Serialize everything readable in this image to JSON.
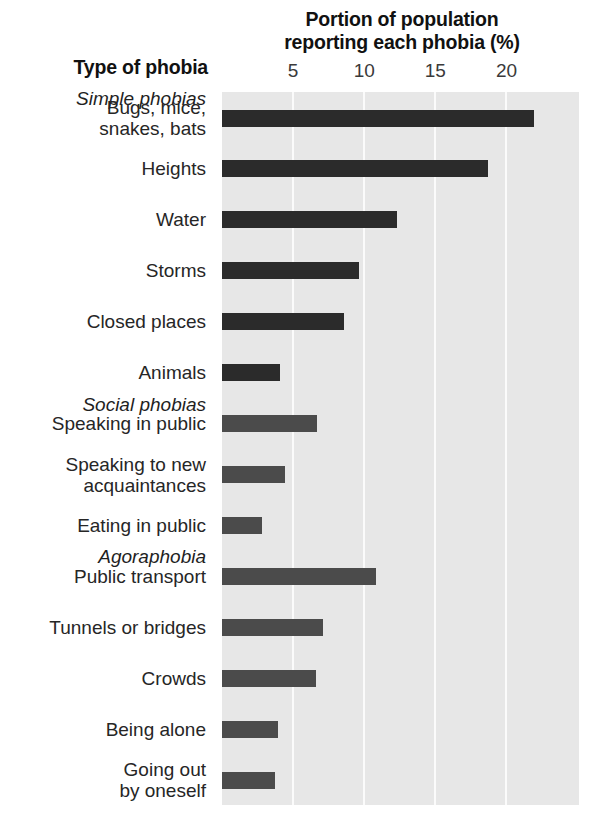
{
  "chart_data": {
    "type": "bar",
    "orientation": "horizontal",
    "title": "Portion of population reporting each phobia (%)",
    "xlabel": "Portion of population reporting each phobia (%)",
    "ylabel": "Type of phobia",
    "xlim": [
      0,
      25.1
    ],
    "xticks": [
      5,
      10,
      15,
      20
    ],
    "xtick_labels": [
      "5",
      "10",
      "15",
      "20"
    ],
    "grid": "vertical-white-on-gray",
    "legend": "none",
    "group_headers": [
      {
        "label": "Simple phobias",
        "before_category": "Bugs, mice, snakes, bats"
      },
      {
        "label": "Social phobias",
        "before_category": "Speaking in public"
      },
      {
        "label": "Agoraphobia",
        "before_category": "Public transport"
      }
    ],
    "categories": [
      "Bugs, mice, snakes, bats",
      "Heights",
      "Water",
      "Storms",
      "Closed places",
      "Animals",
      "Speaking in public",
      "Speaking to new acquaintances",
      "Eating in public",
      "Public transport",
      "Tunnels or bridges",
      "Crowds",
      "Being alone",
      "Going out by oneself"
    ],
    "values": [
      21.9,
      18.7,
      12.3,
      9.6,
      8.6,
      4.1,
      6.7,
      4.4,
      2.8,
      10.8,
      7.1,
      6.6,
      3.9,
      3.7
    ],
    "groups": [
      "simple",
      "simple",
      "simple",
      "simple",
      "simple",
      "simple",
      "social",
      "social",
      "social",
      "agora",
      "agora",
      "agora",
      "agora",
      "agora"
    ]
  },
  "titles": {
    "axis_title_line1": "Portion of population",
    "axis_title_line2": "reporting each phobia (%)",
    "category_axis_title": "Type of phobia"
  },
  "rows": [
    {
      "kind": "header",
      "label": "Simple phobias"
    },
    {
      "kind": "bar",
      "label_lines": [
        "Bugs, mice,",
        "snakes, bats"
      ],
      "value": 21.9,
      "group": "simple"
    },
    {
      "kind": "bar",
      "label_lines": [
        "Heights"
      ],
      "value": 18.7,
      "group": "simple"
    },
    {
      "kind": "bar",
      "label_lines": [
        "Water"
      ],
      "value": 12.3,
      "group": "simple"
    },
    {
      "kind": "bar",
      "label_lines": [
        "Storms"
      ],
      "value": 9.6,
      "group": "simple"
    },
    {
      "kind": "bar",
      "label_lines": [
        "Closed places"
      ],
      "value": 8.6,
      "group": "simple"
    },
    {
      "kind": "bar",
      "label_lines": [
        "Animals"
      ],
      "value": 4.1,
      "group": "simple"
    },
    {
      "kind": "header",
      "label": "Social phobias"
    },
    {
      "kind": "bar",
      "label_lines": [
        "Speaking in public"
      ],
      "value": 6.7,
      "group": "social"
    },
    {
      "kind": "bar",
      "label_lines": [
        "Speaking to new",
        "acquaintances"
      ],
      "value": 4.4,
      "group": "social"
    },
    {
      "kind": "bar",
      "label_lines": [
        "Eating in public"
      ],
      "value": 2.8,
      "group": "social"
    },
    {
      "kind": "header",
      "label": "Agoraphobia"
    },
    {
      "kind": "bar",
      "label_lines": [
        "Public transport"
      ],
      "value": 10.8,
      "group": "agora"
    },
    {
      "kind": "bar",
      "label_lines": [
        "Tunnels or bridges"
      ],
      "value": 7.1,
      "group": "agora"
    },
    {
      "kind": "bar",
      "label_lines": [
        "Crowds"
      ],
      "value": 6.6,
      "group": "agora"
    },
    {
      "kind": "bar",
      "label_lines": [
        "Being alone"
      ],
      "value": 3.9,
      "group": "agora"
    },
    {
      "kind": "bar",
      "label_lines": [
        "Going out",
        "by oneself"
      ],
      "value": 3.7,
      "group": "agora"
    }
  ],
  "colors": {
    "plot_background": "#e7e7e7",
    "gridline": "#fbfbfb",
    "bar_simple": "#2b2b2b",
    "bar_social": "#4b4b4b",
    "bar_agora": "#4b4b4b",
    "text": "#1a1a1a",
    "page_background": "#ffffff"
  }
}
